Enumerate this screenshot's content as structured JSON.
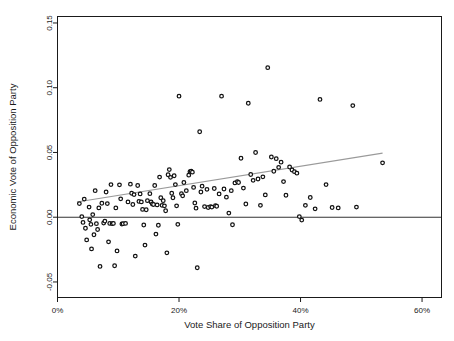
{
  "chart_data": {
    "type": "scatter",
    "title": "",
    "xlabel": "Vote Share of Opposition Party",
    "ylabel": "Economic Vote of Opposition Party",
    "xlim": [
      0,
      0.632
    ],
    "ylim": [
      -0.062,
      0.155
    ],
    "grid": false,
    "legend": null,
    "xticks": [
      0,
      0.2,
      0.4,
      0.6
    ],
    "xticklabels": [
      "0%",
      "20%",
      "40%",
      "60%"
    ],
    "yticks": [
      -0.05,
      0.0,
      0.05,
      0.1,
      0.15
    ],
    "yticklabels": [
      "-0.05",
      "0.00",
      "0.05",
      "0.10",
      "0.15"
    ],
    "reference_line": {
      "orientation": "horizontal",
      "y": 0.0,
      "color": "#333333"
    },
    "fit_line": {
      "type": "linear",
      "color": "#9a9a9a",
      "x_start": 0.032,
      "y_start": 0.0117,
      "x_end": 0.535,
      "y_end": 0.0495,
      "slope": 0.0752,
      "intercept": 0.0093
    },
    "marker": {
      "shape": "circle-open",
      "edge_color": "#111111",
      "face_color": "#ffffff",
      "size": 3.6
    },
    "points": [
      [
        0.036,
        0.0105
      ],
      [
        0.04,
        0.0005
      ],
      [
        0.042,
        -0.004
      ],
      [
        0.044,
        0.014
      ],
      [
        0.046,
        -0.0085
      ],
      [
        0.048,
        -0.0175
      ],
      [
        0.052,
        0.0078
      ],
      [
        0.053,
        -0.002
      ],
      [
        0.055,
        -0.0055
      ],
      [
        0.056,
        -0.0245
      ],
      [
        0.058,
        0.002
      ],
      [
        0.06,
        -0.0135
      ],
      [
        0.062,
        0.0205
      ],
      [
        0.064,
        -0.005
      ],
      [
        0.066,
        -0.0095
      ],
      [
        0.068,
        0.0072
      ],
      [
        0.07,
        -0.038
      ],
      [
        0.073,
        0.0108
      ],
      [
        0.076,
        -0.0045
      ],
      [
        0.078,
        -0.003
      ],
      [
        0.08,
        0.0195
      ],
      [
        0.082,
        0.0105
      ],
      [
        0.084,
        -0.019
      ],
      [
        0.086,
        -0.0048
      ],
      [
        0.088,
        0.0252
      ],
      [
        0.09,
        -0.005
      ],
      [
        0.092,
        -0.0048
      ],
      [
        0.094,
        -0.0375
      ],
      [
        0.096,
        0.0072
      ],
      [
        0.098,
        -0.026
      ],
      [
        0.102,
        0.025
      ],
      [
        0.104,
        0.0142
      ],
      [
        0.106,
        -0.0052
      ],
      [
        0.108,
        -0.005
      ],
      [
        0.112,
        -0.0048
      ],
      [
        0.116,
        0.0118
      ],
      [
        0.12,
        0.0255
      ],
      [
        0.122,
        0.0185
      ],
      [
        0.124,
        0.0098
      ],
      [
        0.126,
        0.0175
      ],
      [
        0.128,
        -0.03
      ],
      [
        0.132,
        0.0245
      ],
      [
        0.134,
        0.0122
      ],
      [
        0.136,
        0.018
      ],
      [
        0.138,
        0.0118
      ],
      [
        0.14,
        0.006
      ],
      [
        0.142,
        -0.006
      ],
      [
        0.144,
        -0.0215
      ],
      [
        0.146,
        0.0058
      ],
      [
        0.148,
        0.0128
      ],
      [
        0.152,
        0.0182
      ],
      [
        0.154,
        0.0118
      ],
      [
        0.156,
        0.0102
      ],
      [
        0.158,
        0.0098
      ],
      [
        0.16,
        0.0245
      ],
      [
        0.162,
        -0.013
      ],
      [
        0.164,
        0.0095
      ],
      [
        0.166,
        -0.0062
      ],
      [
        0.168,
        0.031
      ],
      [
        0.17,
        0.015
      ],
      [
        0.172,
        0.0092
      ],
      [
        0.174,
        0.0128
      ],
      [
        0.176,
        0.0088
      ],
      [
        0.178,
        0.005
      ],
      [
        0.18,
        -0.0275
      ],
      [
        0.182,
        0.0328
      ],
      [
        0.184,
        0.0368
      ],
      [
        0.186,
        0.0308
      ],
      [
        0.188,
        0.0185
      ],
      [
        0.19,
        0.015
      ],
      [
        0.192,
        0.032
      ],
      [
        0.194,
        0.0252
      ],
      [
        0.196,
        0.0088
      ],
      [
        0.198,
        -0.0055
      ],
      [
        0.2,
        0.0935
      ],
      [
        0.204,
        0.0182
      ],
      [
        0.206,
        0.0165
      ],
      [
        0.208,
        0.0268
      ],
      [
        0.212,
        0.0205
      ],
      [
        0.216,
        0.0325
      ],
      [
        0.218,
        0.0352
      ],
      [
        0.22,
        0.0355
      ],
      [
        0.222,
        0.0348
      ],
      [
        0.224,
        0.023
      ],
      [
        0.226,
        0.011
      ],
      [
        0.228,
        0.007
      ],
      [
        0.23,
        -0.039
      ],
      [
        0.234,
        0.066
      ],
      [
        0.236,
        0.0195
      ],
      [
        0.238,
        0.024
      ],
      [
        0.242,
        0.0082
      ],
      [
        0.246,
        0.0215
      ],
      [
        0.248,
        0.0075
      ],
      [
        0.252,
        0.0082
      ],
      [
        0.254,
        0.0078
      ],
      [
        0.258,
        0.0222
      ],
      [
        0.26,
        0.009
      ],
      [
        0.262,
        0.0085
      ],
      [
        0.266,
        0.018
      ],
      [
        0.27,
        0.0935
      ],
      [
        0.274,
        0.0218
      ],
      [
        0.278,
        0.0155
      ],
      [
        0.282,
        0.0032
      ],
      [
        0.286,
        0.0205
      ],
      [
        0.288,
        -0.0058
      ],
      [
        0.292,
        0.0265
      ],
      [
        0.296,
        0.0275
      ],
      [
        0.298,
        0.0268
      ],
      [
        0.302,
        0.0455
      ],
      [
        0.306,
        0.0225
      ],
      [
        0.31,
        0.0102
      ],
      [
        0.314,
        0.088
      ],
      [
        0.318,
        0.033
      ],
      [
        0.322,
        0.0285
      ],
      [
        0.326,
        0.05
      ],
      [
        0.33,
        0.0295
      ],
      [
        0.334,
        0.0092
      ],
      [
        0.338,
        0.0312
      ],
      [
        0.342,
        0.0172
      ],
      [
        0.346,
        0.1155
      ],
      [
        0.352,
        0.0465
      ],
      [
        0.356,
        0.0355
      ],
      [
        0.36,
        0.0452
      ],
      [
        0.364,
        0.0385
      ],
      [
        0.368,
        0.0425
      ],
      [
        0.372,
        0.0275
      ],
      [
        0.376,
        0.017
      ],
      [
        0.382,
        0.0388
      ],
      [
        0.386,
        0.0365
      ],
      [
        0.39,
        0.0352
      ],
      [
        0.394,
        0.034
      ],
      [
        0.398,
        0.0005
      ],
      [
        0.402,
        -0.0022
      ],
      [
        0.408,
        0.0092
      ],
      [
        0.416,
        0.0152
      ],
      [
        0.424,
        0.0065
      ],
      [
        0.432,
        0.091
      ],
      [
        0.442,
        0.0252
      ],
      [
        0.452,
        0.0075
      ],
      [
        0.462,
        0.0072
      ],
      [
        0.486,
        0.0862
      ],
      [
        0.492,
        0.0078
      ],
      [
        0.535,
        0.042
      ]
    ]
  }
}
